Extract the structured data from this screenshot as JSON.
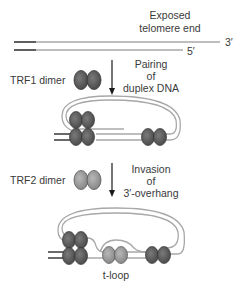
{
  "diagram": {
    "title_line1": "Exposed",
    "title_line2": "telomere end",
    "end_3prime": "3′",
    "end_5prime": "5′",
    "trf1_label": "TRF1 dimer",
    "step1_line1": "Pairing",
    "step1_line2": "of",
    "step1_line3": "duplex DNA",
    "trf2_label": "TRF2 dimer",
    "step2_line1": "Invasion",
    "step2_line2": "of",
    "step2_line3": "3′-overhang",
    "tloop_label": "t-loop",
    "colors": {
      "trf1": "#5c5c5c",
      "trf2": "#9a9a9a",
      "dna_gray": "#a8a8a8",
      "dna_dark": "#1a1a1a",
      "text": "#3a3a3a"
    }
  }
}
